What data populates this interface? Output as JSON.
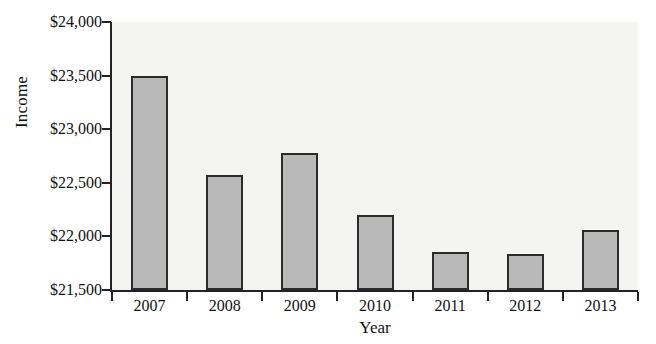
{
  "chart_data": {
    "type": "bar",
    "title": "",
    "xlabel": "Year",
    "ylabel": "Income",
    "categories": [
      "2007",
      "2008",
      "2009",
      "2010",
      "2011",
      "2012",
      "2013"
    ],
    "values": [
      23500,
      22575,
      22775,
      22200,
      21850,
      21840,
      22060
    ],
    "ylim": [
      21500,
      24000
    ],
    "ytick_values": [
      24000,
      23500,
      23000,
      22500,
      22000,
      21500
    ],
    "ytick_labels": [
      "$24,000",
      "$23,500",
      "$23,000",
      "$22,500",
      "$22,000",
      "$21,500"
    ],
    "grid": false,
    "legend": null,
    "bar_fill_color": "#b9b9b9",
    "bar_border_color": "#2b2b2b",
    "plot_background_color": "#f4f4f2",
    "axis_color": "#232323"
  }
}
